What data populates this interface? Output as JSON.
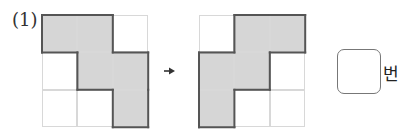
{
  "problem": {
    "label": "(1)",
    "unit": "번",
    "answer_value": ""
  },
  "grids": {
    "before": {
      "rows": 3,
      "cols": 3,
      "shaded": [
        [
          0,
          0
        ],
        [
          0,
          1
        ],
        [
          1,
          1
        ],
        [
          1,
          2
        ],
        [
          2,
          2
        ]
      ]
    },
    "after": {
      "rows": 3,
      "cols": 3,
      "shaded": [
        [
          0,
          1
        ],
        [
          0,
          2
        ],
        [
          1,
          0
        ],
        [
          1,
          1
        ],
        [
          2,
          0
        ]
      ]
    }
  },
  "colors": {
    "shade": "#d6d6d6",
    "grid_line": "#d8d8d8",
    "outline": "#555555"
  },
  "icons": {
    "arrow": "right-arrow-icon"
  }
}
